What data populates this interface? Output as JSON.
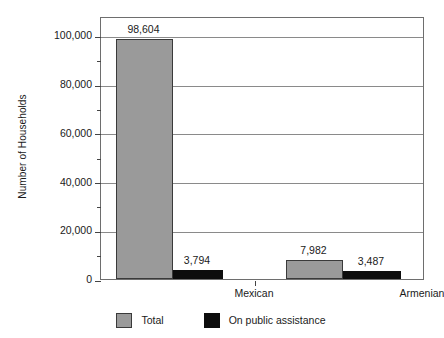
{
  "chart_data": {
    "type": "bar",
    "title": "",
    "xlabel": "",
    "ylabel": "Number of Households",
    "categories": [
      "Mexican",
      "Armenian"
    ],
    "series": [
      {
        "name": "Total",
        "color": "#9a9a9a",
        "values": [
          98604,
          7982
        ],
        "labels": [
          "98,604",
          "7,982"
        ]
      },
      {
        "name": "On public assistance",
        "color": "#0d0d0d",
        "values": [
          3794,
          3487
        ],
        "labels": [
          "3,794",
          "3,487"
        ]
      }
    ],
    "ylim": [
      0,
      108000
    ],
    "ytick_major": [
      0,
      20000,
      40000,
      60000,
      80000,
      100000
    ],
    "ytick_major_labels": [
      "0",
      "20,000",
      "40,000",
      "60,000",
      "80,000",
      "100,000"
    ],
    "ytick_minor": [
      10000,
      30000,
      50000,
      70000,
      90000
    ],
    "grid": "horizontal",
    "legend_position": "bottom"
  },
  "legend": {
    "entries": [
      {
        "label": "Total",
        "swatch": "total-swatch"
      },
      {
        "label": "On public assistance",
        "swatch": "assistance-swatch"
      }
    ]
  }
}
